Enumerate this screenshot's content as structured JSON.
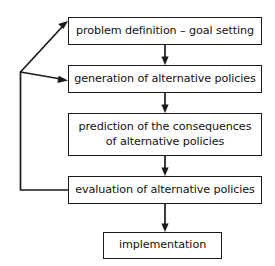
{
  "diagram": {
    "type": "flowchart",
    "background_color": "#ffffff",
    "stroke_color": "#1a1a1a",
    "text_color": "#111111",
    "nodes": [
      {
        "id": "problem-definition",
        "label": "problem definition – goal setting",
        "order": "1"
      },
      {
        "id": "generation",
        "label": "generation of alternative policies",
        "order": "2"
      },
      {
        "id": "prediction",
        "label": "prediction of the consequences\nof alternative policies",
        "order": "3"
      },
      {
        "id": "evaluation",
        "label": "evaluation of alternative policies",
        "order": "4"
      },
      {
        "id": "implementation",
        "label": "implementation",
        "order": "5"
      }
    ],
    "connectors": [
      {
        "id": "arrow-problem-to-generation",
        "from": "problem-definition",
        "to": "generation",
        "style": "straight-down-arrow"
      },
      {
        "id": "arrow-generation-to-prediction",
        "from": "generation",
        "to": "prediction",
        "style": "straight-down-arrow"
      },
      {
        "id": "arrow-prediction-to-evaluation",
        "from": "prediction",
        "to": "evaluation",
        "style": "straight-down-arrow"
      },
      {
        "id": "arrow-evaluation-to-implementation",
        "from": "evaluation",
        "to": "implementation",
        "style": "straight-down-arrow"
      },
      {
        "id": "feedback-evaluation-to-junction",
        "from": "evaluation",
        "to": "feedback-junction",
        "style": "elbow-line"
      },
      {
        "id": "feedback-junction-to-problem",
        "from": "feedback-junction",
        "to": "problem-definition",
        "style": "diagonal-arrow"
      },
      {
        "id": "feedback-junction-to-generation",
        "from": "feedback-junction",
        "to": "generation",
        "style": "diagonal-arrow"
      }
    ]
  }
}
